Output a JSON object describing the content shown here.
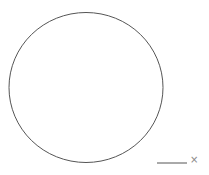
{
  "chart_data": {
    "type": "line",
    "title": "",
    "xlabel": "",
    "ylabel": "",
    "series": [
      {
        "name": "circle",
        "shape": "circle",
        "center": [
          0,
          0
        ],
        "radius": 1,
        "color": "#555555"
      }
    ],
    "legend": {
      "placement": "bottom-right",
      "entries": [
        {
          "line_color": "#555555",
          "marker": "×",
          "marker_color": "#888888",
          "label": ""
        }
      ]
    },
    "grid": false,
    "axes_visible": false
  }
}
